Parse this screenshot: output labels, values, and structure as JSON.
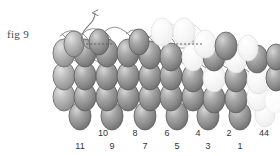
{
  "figure": {
    "caption": "fig 9",
    "title": "fig 9",
    "background_color": "#ffffff",
    "width": 280,
    "height": 156
  },
  "colors": {
    "loop_dark_edge": "#5e5e5e",
    "loop_dark_fill": "#8f8f8f",
    "loop_dark_highlight": "#d2d2d2",
    "loop_pale_edge": "#dcdcdc",
    "loop_pale_fill": "#f2f2f2",
    "loop_pale_highlight": "#fdfdfd",
    "strand_stroke": "#6b6b6b",
    "dashed_stroke": "#555555",
    "arrow_stroke": "#7a7a7a",
    "label_text": "#333333",
    "caption_text": "#4a4a4a"
  },
  "labels": {
    "upper_row": [
      {
        "text": "10",
        "x": 103,
        "y": 134
      },
      {
        "text": "8",
        "x": 135,
        "y": 134
      },
      {
        "text": "6",
        "x": 167,
        "y": 134
      },
      {
        "text": "4",
        "x": 198,
        "y": 134
      },
      {
        "text": "2",
        "x": 229,
        "y": 134
      },
      {
        "text": "44",
        "x": 262,
        "y": 134
      }
    ],
    "lower_row": [
      {
        "text": "11",
        "x": 80,
        "y": 148
      },
      {
        "text": "9",
        "x": 112,
        "y": 148
      },
      {
        "text": "7",
        "x": 145,
        "y": 148
      },
      {
        "text": "5",
        "x": 177,
        "y": 148
      },
      {
        "text": "3",
        "x": 208,
        "y": 148
      },
      {
        "text": "1",
        "x": 240,
        "y": 148
      }
    ]
  },
  "annotations": {
    "arrow": {
      "name": "curved-up-arrow",
      "description": "thin curved leader line sweeping up and ending in an open arrowhead above the lattice"
    },
    "dashed_lines": [
      {
        "name": "dashed-index-line-left",
        "x1": 86,
        "x2": 112,
        "y": 44
      },
      {
        "name": "dashed-index-line-right",
        "x1": 175,
        "x2": 200,
        "y": 44
      }
    ]
  },
  "lattice": {
    "description": "Four staggered rows of ellipses; leftmost and rightmost regions fade to pale outline-only loops.",
    "rows": 4,
    "ellipse_rx": 11,
    "ellipse_ry": 14,
    "row_y": [
      44,
      68,
      92,
      116
    ],
    "col_pitch": 21.5
  }
}
